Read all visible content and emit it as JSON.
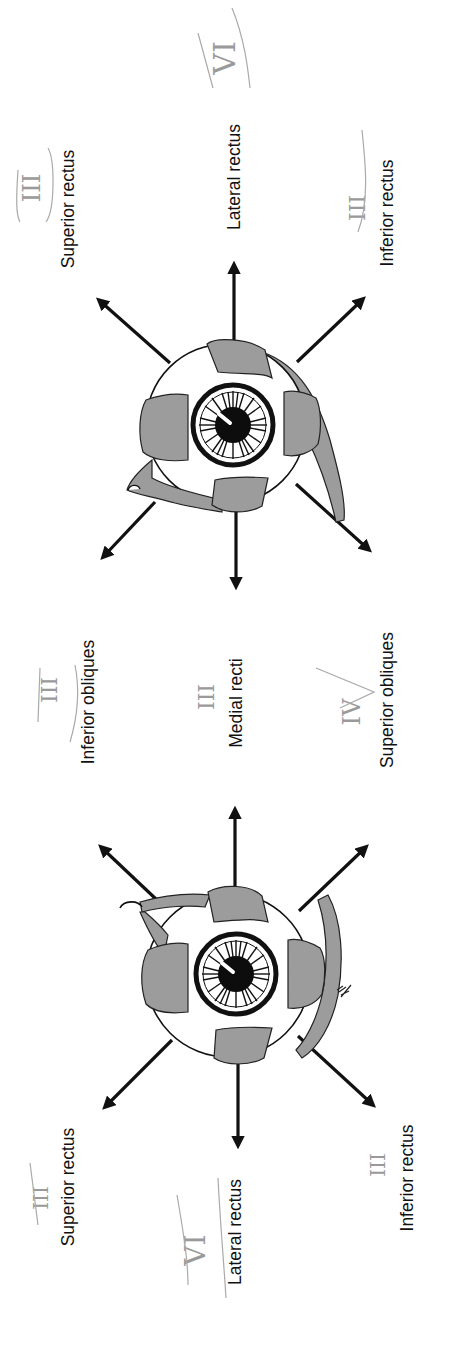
{
  "figure": {
    "orientation": "rotated 90° counter-clockwise",
    "colors": {
      "ink": "#111111",
      "muscle_fill": "#9c9c9c",
      "annotation_pencil": "#a0a0a0",
      "background": "#ffffff"
    }
  },
  "top_eye": {
    "labels": {
      "superior_rectus": "Superior rectus",
      "lateral_rectus": "Lateral rectus",
      "inferior_rectus": "Inferior rectus"
    },
    "annotations": {
      "superior_rectus_nerve": "III",
      "lateral_rectus_nerve": "VI",
      "inferior_rectus_nerve": "III"
    }
  },
  "middle": {
    "labels": {
      "inferior_obliques": "Inferior obliques",
      "medial_recti": "Medial recti",
      "superior_obliques": "Superior obliques"
    },
    "annotations": {
      "inferior_obliques_nerve": "III",
      "medial_recti_nerve": "III",
      "superior_obliques_nerve": "IV"
    }
  },
  "bottom_eye": {
    "labels": {
      "superior_rectus": "Superior rectus",
      "lateral_rectus": "Lateral rectus",
      "inferior_rectus": "Inferior rectus"
    },
    "annotations": {
      "superior_rectus_nerve": "III",
      "lateral_rectus_nerve": "VI",
      "inferior_rectus_nerve": "III"
    }
  }
}
